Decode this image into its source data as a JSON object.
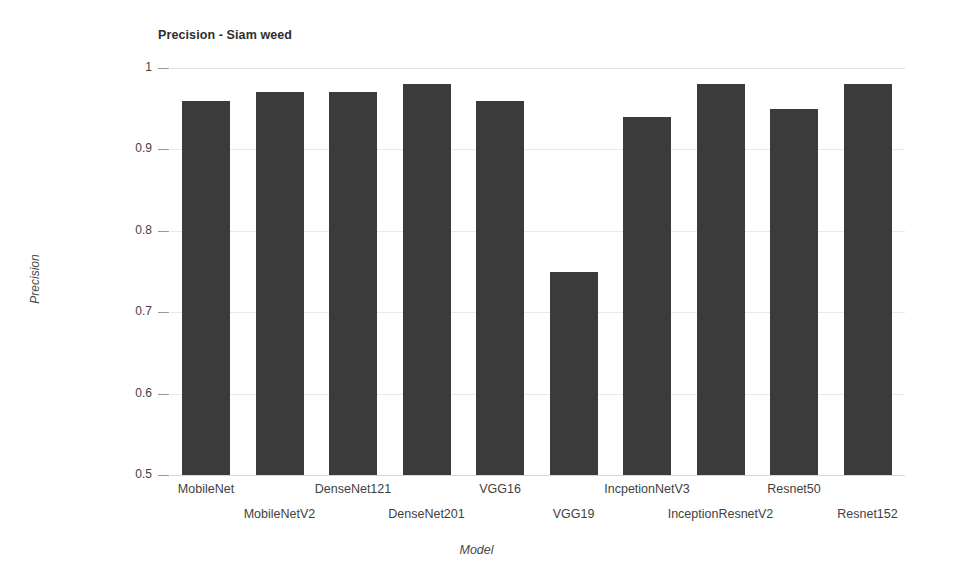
{
  "chart_data": {
    "type": "bar",
    "title": "Precision - Siam weed",
    "xlabel": "Model",
    "ylabel": "Precision",
    "categories": [
      "MobileNet",
      "MobileNetV2",
      "DenseNet121",
      "DenseNet201",
      "VGG16",
      "VGG19",
      "IncpetionNetV3",
      "InceptionResnetV2",
      "Resnet50",
      "Resnet152"
    ],
    "values": [
      0.96,
      0.97,
      0.97,
      0.98,
      0.96,
      0.75,
      0.94,
      0.98,
      0.95,
      0.98
    ],
    "ylim": [
      0.5,
      1.0
    ],
    "ytick_labels": [
      "1",
      "0.9",
      "0.8",
      "0.7",
      "0.6",
      "0.5"
    ],
    "ytick_values": [
      1,
      0.9,
      0.8,
      0.7,
      0.6,
      0.5
    ],
    "grid": true,
    "legend": false,
    "bar_color": "#3b3b3b",
    "background_color": "#ffffff",
    "gridline_color": "#e9e9e9",
    "label_stagger": [
      0,
      1,
      0,
      1,
      0,
      1,
      0,
      1,
      0,
      1
    ]
  }
}
